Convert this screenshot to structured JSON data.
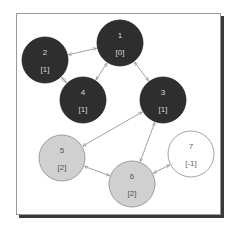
{
  "colors": {
    "visited": "#2e2e2e",
    "visited_text": "#d8d8d8",
    "frontier": "#d0d0d0",
    "frontier_text": "#555555",
    "unvisited": "#ffffff",
    "unvisited_text": "#666666",
    "edge": "#8a8a8a",
    "frame_border": "#9a9a9a",
    "frame_shadow": "#3a3a3a"
  },
  "nodes": [
    {
      "id": "1",
      "distance": "[0]",
      "x": 120,
      "y": 43,
      "state": "visited"
    },
    {
      "id": "2",
      "distance": "[1]",
      "x": 45,
      "y": 60,
      "state": "visited"
    },
    {
      "id": "3",
      "distance": "[1]",
      "x": 163,
      "y": 100,
      "state": "visited"
    },
    {
      "id": "4",
      "distance": "[1]",
      "x": 83,
      "y": 100,
      "state": "visited"
    },
    {
      "id": "5",
      "distance": "[2]",
      "x": 62,
      "y": 158,
      "state": "frontier"
    },
    {
      "id": "6",
      "distance": "[2]",
      "x": 132,
      "y": 184,
      "state": "frontier"
    },
    {
      "id": "7",
      "distance": "[-1]",
      "x": 191,
      "y": 154,
      "state": "unvisited"
    }
  ],
  "edges": [
    {
      "from": "1",
      "to": "2",
      "direction": "both"
    },
    {
      "from": "1",
      "to": "4",
      "direction": "both"
    },
    {
      "from": "1",
      "to": "3",
      "direction": "both"
    },
    {
      "from": "2",
      "to": "4",
      "direction": "both"
    },
    {
      "from": "3",
      "to": "5",
      "direction": "both"
    },
    {
      "from": "3",
      "to": "6",
      "direction": "both"
    },
    {
      "from": "5",
      "to": "6",
      "direction": "both"
    },
    {
      "from": "6",
      "to": "7",
      "direction": "both"
    }
  ],
  "node_radius": 23
}
